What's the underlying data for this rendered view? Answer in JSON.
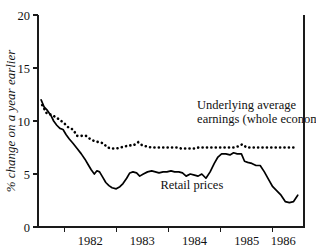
{
  "chart_data": {
    "type": "line",
    "title": "",
    "xlabel": "",
    "ylabel": "% change on a year earlier",
    "ylim": [
      0,
      20
    ],
    "yticks": [
      0,
      5,
      10,
      15,
      20
    ],
    "ytick_labels": [
      "0",
      "5",
      "10",
      "15",
      "20"
    ],
    "xlim": [
      1981.5,
      1986.6
    ],
    "xticks": [
      1982.0,
      1983.0,
      1984.0,
      1985.0,
      1986.0
    ],
    "xtick_labels": [
      "1982",
      "1983",
      "1984",
      "1985",
      "1986"
    ],
    "xtick_label_positions": [
      1982.5,
      1983.5,
      1984.5,
      1985.5,
      1986.2
    ],
    "grid": false,
    "legend": "inline-annotations",
    "annotations": [
      {
        "name": "earnings-label",
        "lines": [
          "Underlying average",
          "earnings (whole economy)"
        ],
        "x": 1984.55,
        "y": 11.1
      },
      {
        "name": "retail-prices-label",
        "lines": [
          "Retail prices"
        ],
        "x": 1984.45,
        "y": 3.6
      }
    ],
    "series": [
      {
        "name": "Underlying average earnings (whole economy)",
        "style": "dotted",
        "x": [
          1981.58,
          1981.67,
          1981.75,
          1981.83,
          1981.92,
          1982.0,
          1982.08,
          1982.17,
          1982.25,
          1982.33,
          1982.42,
          1982.5,
          1982.58,
          1982.67,
          1982.75,
          1982.83,
          1982.92,
          1983.0,
          1983.08,
          1983.17,
          1983.25,
          1983.33,
          1983.42,
          1983.5,
          1983.58,
          1983.67,
          1983.75,
          1983.83,
          1983.92,
          1984.0,
          1984.08,
          1984.17,
          1984.25,
          1984.33,
          1984.42,
          1984.5,
          1984.58,
          1984.67,
          1984.75,
          1984.83,
          1984.92,
          1985.0,
          1985.08,
          1985.17,
          1985.25,
          1985.33,
          1985.42,
          1985.5,
          1985.58,
          1985.67,
          1985.75,
          1985.83,
          1985.92,
          1986.0,
          1986.08,
          1986.17,
          1986.25,
          1986.35,
          1986.45
        ],
        "values": [
          11.5,
          10.7,
          10.6,
          10.4,
          10.1,
          9.8,
          9.4,
          9.2,
          8.6,
          8.6,
          8.6,
          8.3,
          8.1,
          8.0,
          7.9,
          7.5,
          7.4,
          7.4,
          7.5,
          7.6,
          7.7,
          7.7,
          8.0,
          7.7,
          7.6,
          7.5,
          7.5,
          7.5,
          7.5,
          7.5,
          7.5,
          7.5,
          7.4,
          7.4,
          7.4,
          7.4,
          7.5,
          7.5,
          7.5,
          7.5,
          7.5,
          7.5,
          7.5,
          7.5,
          7.5,
          7.6,
          7.8,
          7.5,
          7.5,
          7.5,
          7.5,
          7.5,
          7.5,
          7.5,
          7.5,
          7.5,
          7.5,
          7.5,
          7.5
        ]
      },
      {
        "name": "Retail prices",
        "style": "solid",
        "x": [
          1981.56,
          1981.62,
          1981.68,
          1981.75,
          1981.8,
          1981.86,
          1981.92,
          1981.98,
          1982.04,
          1982.1,
          1982.17,
          1982.25,
          1982.33,
          1982.4,
          1982.46,
          1982.52,
          1982.58,
          1982.63,
          1982.68,
          1982.74,
          1982.8,
          1982.86,
          1982.92,
          1983.0,
          1983.07,
          1983.13,
          1983.2,
          1983.26,
          1983.32,
          1983.39,
          1983.45,
          1983.52,
          1983.6,
          1983.68,
          1983.75,
          1983.82,
          1983.9,
          1983.97,
          1984.05,
          1984.12,
          1984.2,
          1984.27,
          1984.34,
          1984.42,
          1984.5,
          1984.57,
          1984.64,
          1984.72,
          1984.8,
          1984.88,
          1984.95,
          1985.02,
          1985.1,
          1985.18,
          1985.25,
          1985.32,
          1985.4,
          1985.46,
          1985.52,
          1985.6,
          1985.68,
          1985.76,
          1985.84,
          1985.92,
          1986.0,
          1986.08,
          1986.16,
          1986.24,
          1986.32,
          1986.4,
          1986.48
        ],
        "values": [
          12.0,
          11.3,
          11.0,
          10.5,
          10.0,
          9.6,
          9.3,
          9.2,
          8.7,
          8.3,
          7.9,
          7.4,
          6.9,
          6.4,
          5.9,
          5.4,
          5.0,
          5.3,
          5.2,
          4.7,
          4.2,
          3.9,
          3.7,
          3.6,
          3.8,
          4.1,
          4.6,
          5.1,
          5.2,
          5.1,
          4.8,
          5.0,
          5.2,
          5.3,
          5.2,
          5.1,
          5.2,
          5.2,
          5.3,
          5.2,
          5.2,
          5.1,
          4.8,
          5.0,
          4.9,
          4.8,
          5.0,
          4.6,
          5.2,
          6.0,
          6.6,
          6.9,
          6.9,
          6.8,
          7.0,
          6.9,
          6.9,
          6.2,
          6.1,
          6.0,
          5.8,
          5.8,
          5.2,
          4.5,
          3.8,
          3.4,
          3.0,
          2.4,
          2.3,
          2.4,
          3.0
        ]
      }
    ]
  }
}
